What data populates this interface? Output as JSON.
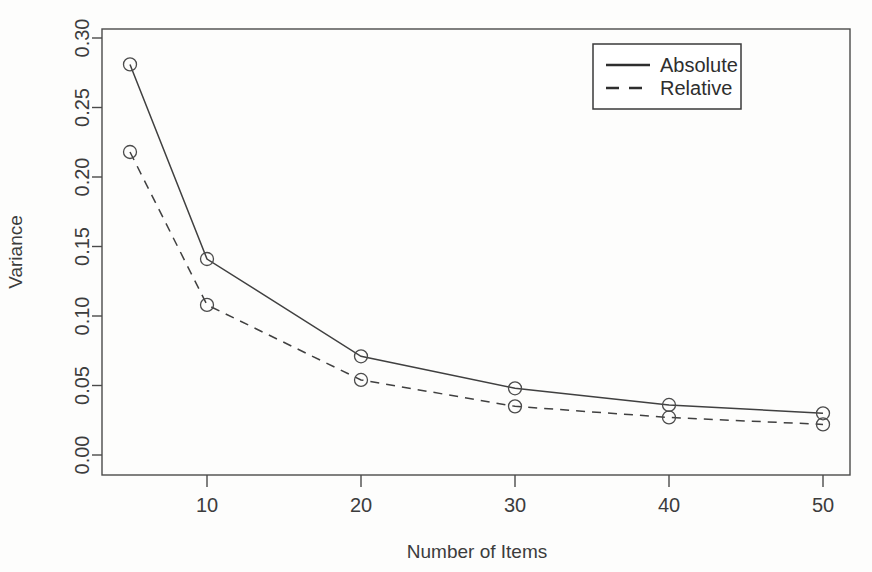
{
  "chart_data": {
    "type": "line",
    "title": "",
    "xlabel": "Number of Items",
    "ylabel": "Variance",
    "x": [
      5,
      10,
      20,
      30,
      40,
      50
    ],
    "xlim": [
      2,
      53
    ],
    "ylim": [
      0.0,
      0.3
    ],
    "xticks": [
      10,
      20,
      30,
      40,
      50
    ],
    "xtick_labels": [
      "10",
      "20",
      "30",
      "40",
      "50"
    ],
    "yticks": [
      0.0,
      0.05,
      0.1,
      0.15,
      0.2,
      0.25,
      0.3
    ],
    "ytick_labels": [
      "0.00",
      "0.05",
      "0.10",
      "0.15",
      "0.20",
      "0.25",
      "0.30"
    ],
    "grid": false,
    "legend_position": "top-right",
    "series": [
      {
        "name": "Absolute",
        "style": "solid",
        "marker": "circle",
        "values": [
          0.281,
          0.141,
          0.071,
          0.048,
          0.036,
          0.03
        ]
      },
      {
        "name": "Relative",
        "style": "dashed",
        "marker": "circle",
        "values": [
          0.218,
          0.108,
          0.054,
          0.035,
          0.027,
          0.022
        ]
      }
    ]
  },
  "axes": {
    "y_title": "Variance",
    "x_title": "Number of Items"
  },
  "legend": {
    "entries": [
      {
        "label": "Absolute",
        "style": "solid"
      },
      {
        "label": "Relative",
        "style": "dashed"
      }
    ]
  },
  "ticks": {
    "y": [
      "0.30",
      "0.25",
      "0.20",
      "0.15",
      "0.10",
      "0.05",
      "0.00"
    ],
    "x": [
      "10",
      "20",
      "30",
      "40",
      "50"
    ]
  },
  "colors": {
    "line": "#404040",
    "frame": "#4a4a4a",
    "text": "#3c3c3c",
    "background": "#fdfdfc"
  }
}
